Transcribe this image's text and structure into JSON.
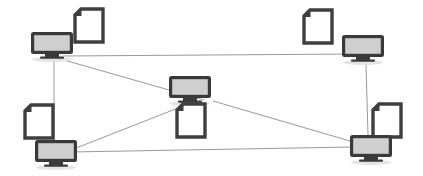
{
  "diagram": {
    "type": "network-topology",
    "canvas": {
      "width": 423,
      "height": 176,
      "background": "#ffffff"
    },
    "colors": {
      "node_outline": "#3a3a3a",
      "node_screen_fill": "#cfcfcf",
      "document_outline": "#3f3f3f",
      "document_fill": "#ffffff",
      "document_fold": "#3f3f3f",
      "link_stroke": "#9a9a9a",
      "shadow": "#e4e4e4"
    },
    "nodes": [
      {
        "id": "node-top-left",
        "label": "Computer top left",
        "icon": "monitor-icon",
        "monitor": {
          "x": 29,
          "y": 30,
          "width": 44,
          "height": 30
        },
        "document": {
          "id": "document-top-left",
          "icon": "document-icon",
          "x": 72,
          "y": 7,
          "width": 34,
          "height": 38
        }
      },
      {
        "id": "node-top-right",
        "label": "Computer top right",
        "icon": "monitor-icon",
        "monitor": {
          "x": 340,
          "y": 33,
          "width": 45,
          "height": 31
        },
        "document": {
          "id": "document-top-right",
          "icon": "document-icon",
          "x": 301,
          "y": 8,
          "width": 34,
          "height": 38
        }
      },
      {
        "id": "node-center",
        "label": "Computer center",
        "icon": "monitor-icon",
        "monitor": {
          "x": 167,
          "y": 74,
          "width": 44,
          "height": 30
        },
        "document": {
          "id": "document-center",
          "icon": "document-icon",
          "x": 174,
          "y": 102,
          "width": 34,
          "height": 38
        }
      },
      {
        "id": "node-bottom-left",
        "label": "Computer bottom left",
        "icon": "monitor-icon",
        "monitor": {
          "x": 33,
          "y": 138,
          "width": 45,
          "height": 31
        },
        "document": {
          "id": "document-bottom-left",
          "icon": "document-icon",
          "x": 22,
          "y": 103,
          "width": 34,
          "height": 38
        }
      },
      {
        "id": "node-bottom-right",
        "label": "Computer bottom right",
        "icon": "monitor-icon",
        "monitor": {
          "x": 348,
          "y": 133,
          "width": 45,
          "height": 31
        },
        "document": {
          "id": "document-bottom-right",
          "icon": "document-icon",
          "x": 370,
          "y": 102,
          "width": 34,
          "height": 38
        }
      }
    ],
    "links": [
      {
        "id": "link-top-left-top-right",
        "from": "node-top-left",
        "to": "node-top-right",
        "x1": 63,
        "y1": 56,
        "x2": 356,
        "y2": 54
      },
      {
        "id": "link-top-left-center",
        "from": "node-top-left",
        "to": "node-center",
        "x1": 64,
        "y1": 60,
        "x2": 204,
        "y2": 100
      },
      {
        "id": "link-top-left-bottom-left",
        "from": "node-top-left",
        "to": "node-bottom-left",
        "x1": 54,
        "y1": 61,
        "x2": 54,
        "y2": 140
      },
      {
        "id": "link-top-right-bottom-right",
        "from": "node-top-right",
        "to": "node-bottom-right",
        "x1": 366,
        "y1": 64,
        "x2": 368,
        "y2": 135
      },
      {
        "id": "link-bottom-left-bottom-right",
        "from": "node-bottom-left",
        "to": "node-bottom-right",
        "x1": 70,
        "y1": 152,
        "x2": 352,
        "y2": 147
      },
      {
        "id": "link-bottom-left-center",
        "from": "node-bottom-left",
        "to": "node-center",
        "x1": 71,
        "y1": 150,
        "x2": 196,
        "y2": 101
      },
      {
        "id": "link-center-bottom-right",
        "from": "node-center",
        "to": "node-bottom-right",
        "x1": 213,
        "y1": 101,
        "x2": 350,
        "y2": 141
      }
    ]
  }
}
